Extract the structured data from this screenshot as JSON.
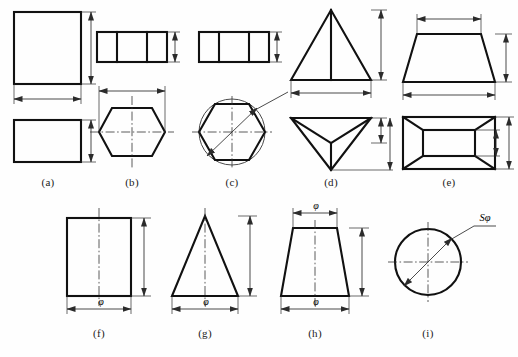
{
  "figure": {
    "background_color": "#fefefe",
    "line_color": "#111111",
    "dimension_color": "#2b2b2b",
    "width": 518,
    "height": 357
  },
  "captions": {
    "a": "(a)",
    "b": "(b)",
    "c": "(c)",
    "d": "(d)",
    "e": "(e)",
    "f": "(f)",
    "g": "(g)",
    "h": "(h)",
    "i": "(i)"
  },
  "dimension_labels": {
    "phi": "φ",
    "sphi": "Sφ"
  },
  "panels": [
    {
      "id": "a",
      "caption": "(a)",
      "shape": "rectangular-prism",
      "views": [
        "front-rectangle",
        "top-rectangle"
      ],
      "dimensions": [
        "height",
        "width",
        "depth"
      ],
      "labels": []
    },
    {
      "id": "b",
      "caption": "(b)",
      "shape": "hexagonal-prism",
      "views": [
        "front-rectangle-divided",
        "top-hexagon"
      ],
      "dimensions": [
        "height",
        "across-corners"
      ],
      "labels": []
    },
    {
      "id": "c",
      "caption": "(c)",
      "shape": "hexagonal-prism-inscribed",
      "views": [
        "front-rectangle-divided",
        "top-hexagon-in-circle"
      ],
      "dimensions": [
        "height",
        "diagonal"
      ],
      "labels": []
    },
    {
      "id": "d",
      "caption": "(d)",
      "shape": "triangular-pyramid",
      "views": [
        "front-triangle",
        "top-triangle"
      ],
      "dimensions": [
        "height",
        "base-width",
        "depth"
      ],
      "labels": []
    },
    {
      "id": "e",
      "caption": "(e)",
      "shape": "truncated-rectangular-pyramid",
      "views": [
        "front-trapezoid",
        "top-rectangle-frustum"
      ],
      "dimensions": [
        "top-width",
        "height",
        "bottom-width",
        "depth-top",
        "depth-bottom"
      ],
      "labels": []
    },
    {
      "id": "f",
      "caption": "(f)",
      "shape": "cylinder",
      "views": [
        "front-rectangle-with-centerline"
      ],
      "dimensions": [
        "height",
        "diameter"
      ],
      "labels": [
        "φ"
      ]
    },
    {
      "id": "g",
      "caption": "(g)",
      "shape": "cone",
      "views": [
        "front-triangle-with-centerline"
      ],
      "dimensions": [
        "height",
        "base-diameter"
      ],
      "labels": [
        "φ"
      ]
    },
    {
      "id": "h",
      "caption": "(h)",
      "shape": "truncated-cone",
      "views": [
        "front-trapezoid-with-centerline"
      ],
      "dimensions": [
        "top-diameter",
        "height",
        "bottom-diameter"
      ],
      "labels": [
        "φ",
        "φ"
      ]
    },
    {
      "id": "i",
      "caption": "(i)",
      "shape": "sphere",
      "views": [
        "circle-with-centerlines"
      ],
      "dimensions": [
        "spherical-diameter"
      ],
      "labels": [
        "Sφ"
      ]
    }
  ]
}
